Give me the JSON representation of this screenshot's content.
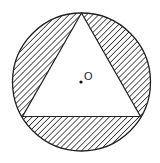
{
  "diagram": {
    "center_label": "O",
    "colors": {
      "stroke": "#222222",
      "hatch": "#333333",
      "background": "#ffffff"
    }
  }
}
